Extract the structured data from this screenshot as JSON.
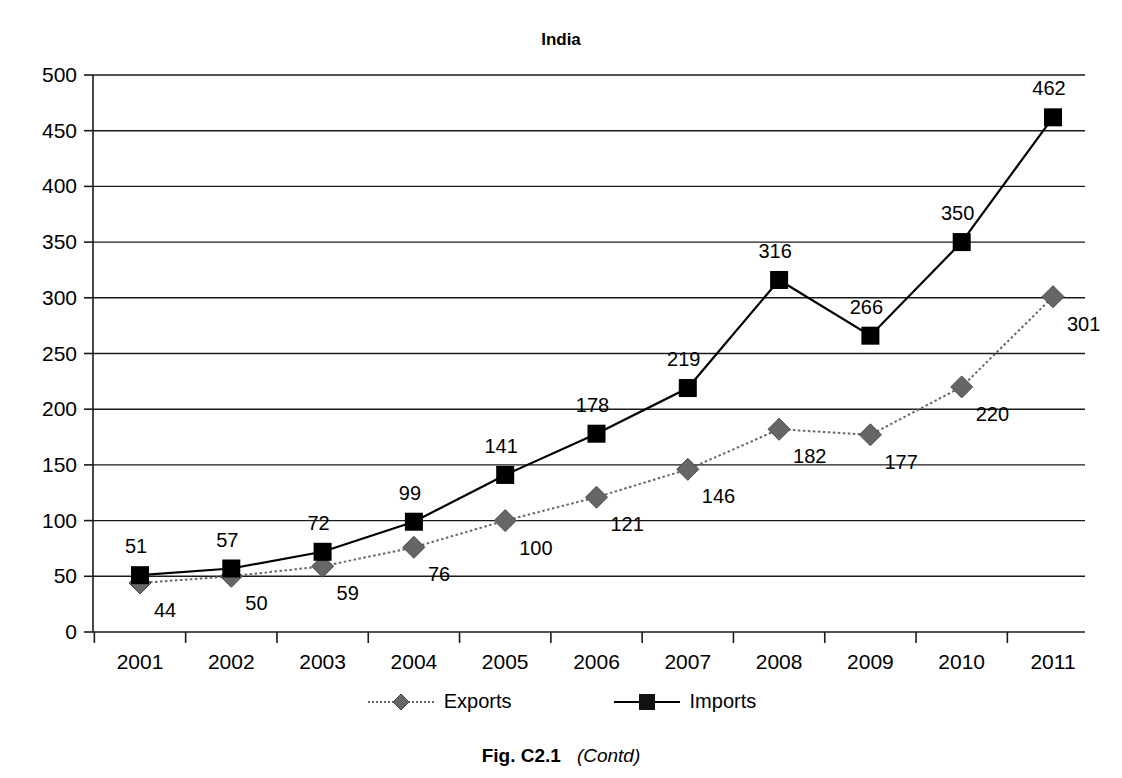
{
  "figure": {
    "caption_id": "Fig. C2.1",
    "caption_note": "(Contd)"
  },
  "legend": {
    "exports_label": "Exports",
    "imports_label": "Imports"
  },
  "chart_data": {
    "type": "line",
    "title": "India",
    "xlabel": "",
    "ylabel": "",
    "categories": [
      "2001",
      "2002",
      "2003",
      "2004",
      "2005",
      "2006",
      "2007",
      "2008",
      "2009",
      "2010",
      "2011"
    ],
    "ylim": [
      0,
      500
    ],
    "yticks": [
      0,
      50,
      100,
      150,
      200,
      250,
      300,
      350,
      400,
      450,
      500
    ],
    "ytick_labels": [
      "0",
      "50",
      "100",
      "150",
      "200",
      "250",
      "300",
      "350",
      "400",
      "450",
      "500"
    ],
    "grid": true,
    "legend_position": "bottom",
    "series": [
      {
        "name": "Exports",
        "marker": "diamond",
        "line_style": "dotted",
        "color": "#666666",
        "label_position": "below-right",
        "values": [
          44,
          50,
          59,
          76,
          100,
          121,
          146,
          182,
          177,
          220,
          301
        ],
        "labels": [
          "44",
          "50",
          "59",
          "76",
          "100",
          "121",
          "146",
          "182",
          "177",
          "220",
          "301"
        ]
      },
      {
        "name": "Imports",
        "marker": "square",
        "line_style": "solid",
        "color": "#000000",
        "label_position": "above-right",
        "values": [
          51,
          57,
          72,
          99,
          141,
          178,
          219,
          316,
          266,
          350,
          462
        ],
        "labels": [
          "51",
          "57",
          "72",
          "99",
          "141",
          "178",
          "219",
          "316",
          "266",
          "350",
          "462"
        ]
      }
    ]
  }
}
